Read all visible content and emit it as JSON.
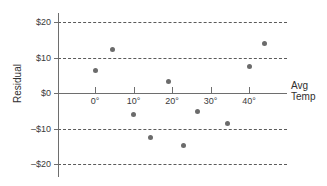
{
  "chart_data": {
    "type": "scatter",
    "title": "",
    "xlabel": "Avg Temp",
    "ylabel": "Residual",
    "xlim": [
      -9,
      50
    ],
    "ylim": [
      -22.5,
      24
    ],
    "grid": true,
    "legend": null,
    "x_tick_labels": [
      "0°",
      "10°",
      "20°",
      "30°",
      "40°"
    ],
    "x_tick_values": [
      0,
      10,
      20,
      30,
      40
    ],
    "y_tick_labels": [
      "$20",
      "$10",
      "$0",
      "–$10",
      "–$20"
    ],
    "y_tick_values": [
      20,
      10,
      0,
      -10,
      -20
    ],
    "gridline_values": [
      20,
      10,
      -10,
      -20
    ],
    "zero_line_value": 0,
    "points": [
      {
        "x": 0.0,
        "y": 6.2
      },
      {
        "x": 4.5,
        "y": 12.3
      },
      {
        "x": 10.0,
        "y": -6.0
      },
      {
        "x": 14.5,
        "y": -12.5
      },
      {
        "x": 19.0,
        "y": 3.3
      },
      {
        "x": 23.0,
        "y": -14.7
      },
      {
        "x": 26.5,
        "y": -5.2
      },
      {
        "x": 34.5,
        "y": -8.5
      },
      {
        "x": 40.0,
        "y": 7.5
      },
      {
        "x": 44.0,
        "y": 14.0
      }
    ]
  },
  "axis_titles": {
    "y": "Residual",
    "x_line1": "Avg",
    "x_line2": "Temp"
  },
  "colors": {
    "point": "#6b6b6b",
    "axis": "#6e6e6e",
    "grid": "#5a5a5a",
    "text": "#3a3a3a",
    "background": "#ffffff"
  }
}
